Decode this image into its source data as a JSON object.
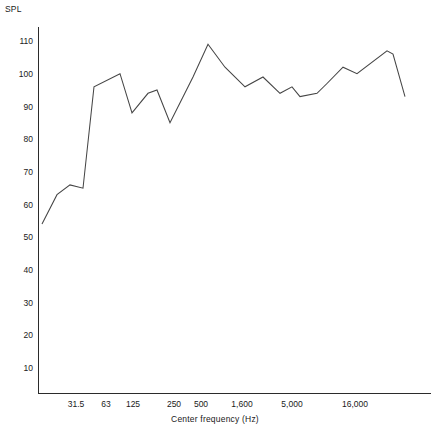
{
  "chart_data": {
    "type": "line",
    "title": "",
    "subtitle": "",
    "xlabel": "Center frequency (Hz)",
    "ylabel": "SPL",
    "grid": false,
    "legend": null,
    "x_scale": "log",
    "x_tick_labels": [
      "31.5",
      "63",
      "125",
      "250",
      "500",
      "1,600",
      "5,000",
      "16,000"
    ],
    "x_tick_pixels": [
      76,
      106,
      133,
      174,
      201,
      242,
      292,
      355
    ],
    "y_tick_labels": [
      "10",
      "20",
      "30",
      "40",
      "50",
      "60",
      "70",
      "80",
      "90",
      "100",
      "110"
    ],
    "y_ticks": [
      10,
      20,
      30,
      40,
      50,
      60,
      70,
      80,
      90,
      100,
      110
    ],
    "ylim": [
      0,
      113
    ],
    "series": [
      {
        "name": "SPL response",
        "color": "#454545",
        "x_pixels": [
          42,
          57,
          70,
          83,
          94,
          120,
          132,
          148,
          157,
          170,
          193,
          208,
          225,
          245,
          263,
          280,
          292,
          300,
          317,
          327,
          343,
          357,
          387,
          393,
          405
        ],
        "values": [
          54,
          63,
          66,
          65,
          96,
          100,
          88,
          94,
          95,
          85,
          99,
          109,
          102,
          96,
          99,
          94,
          96,
          93,
          94,
          97,
          102,
          100,
          107,
          106,
          93
        ]
      }
    ]
  },
  "axes": {
    "y_axis_label": "SPL",
    "x_axis_label": "Center frequency (Hz)"
  }
}
